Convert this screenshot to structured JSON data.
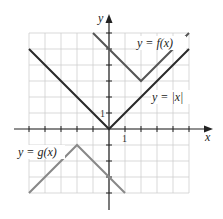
{
  "chart_data": {
    "type": "line",
    "title": "",
    "xlabel": "x",
    "ylabel": "y",
    "xlim": [
      -5,
      5
    ],
    "ylim": [
      -4,
      6
    ],
    "grid": true,
    "tick_labels": {
      "x": [
        "1"
      ],
      "y": [
        "1"
      ]
    },
    "series": [
      {
        "name": "y = f(x)",
        "color": "#555555",
        "x": [
          -1,
          2,
          5
        ],
        "y": [
          6,
          3,
          6
        ]
      },
      {
        "name": "y = |x|",
        "color": "#222222",
        "x": [
          -5,
          0,
          5
        ],
        "y": [
          5,
          0,
          5
        ]
      },
      {
        "name": "y = g(x)",
        "color": "#777777",
        "x": [
          -5,
          -2,
          1
        ],
        "y": [
          -4,
          -1,
          -4
        ]
      }
    ]
  },
  "labels": {
    "f": "y = f(x)",
    "abs": "y = |x|",
    "g": "y = g(x)",
    "x_axis": "x",
    "y_axis": "y",
    "x_tick": "1",
    "y_tick": "1"
  }
}
